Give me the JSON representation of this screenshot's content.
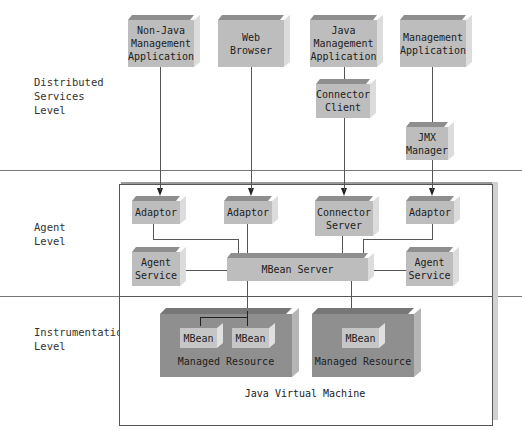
{
  "levels": {
    "distributed": "Distributed\nServices\nLevel",
    "agent": "Agent\nLevel",
    "instrumentation": "Instrumentation\nLevel"
  },
  "distributed_services": {
    "non_java_app": "Non-Java\nManagement\nApplication",
    "web_browser": "Web\nBrowser",
    "java_app": "Java\nManagement\nApplication",
    "mgmt_app": "Management\nApplication",
    "connector_client": "Connector\nClient",
    "jmx_manager": "JMX\nManager"
  },
  "agent": {
    "adaptor_1": "Adaptor",
    "adaptor_2": "Adaptor",
    "connector_server": "Connector\nServer",
    "adaptor_3": "Adaptor",
    "agent_service_left": "Agent\nService",
    "mbean_server": "MBean Server",
    "agent_service_right": "Agent\nService"
  },
  "instrumentation": {
    "resource_1": {
      "label": "Managed Resource",
      "mbeans": [
        "MBean",
        "MBean"
      ]
    },
    "resource_2": {
      "label": "Managed Resource",
      "mbeans": [
        "MBean"
      ]
    }
  },
  "jvm_label": "Java Virtual Machine",
  "colors": {
    "box_fill": "#bdbdbd",
    "resource_fill": "#8f8f8f",
    "line": "#555555"
  }
}
